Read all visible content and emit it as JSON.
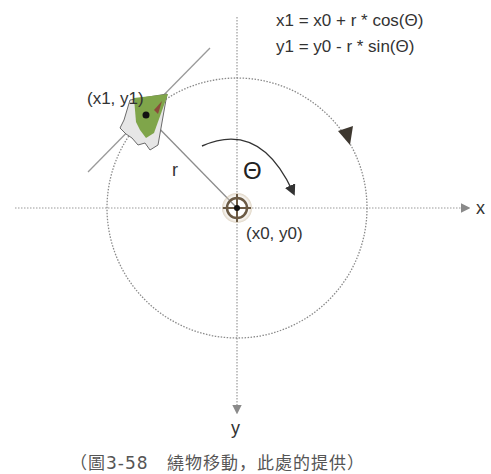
{
  "formulas": {
    "x1": "x1 = x0 + r * cos(Θ)",
    "y1": "y1 = y0 - r * sin(Θ)"
  },
  "labels": {
    "point1": "(x1, y1)",
    "point0": "(x0, y0)",
    "radius": "r",
    "angle": "Θ",
    "x_axis": "x",
    "y_axis": "y"
  },
  "caption": "（圖3-58　繞物移動，此處的提供）",
  "colors": {
    "object_green": "#7fa54a",
    "object_shadow": "#cfcfcf",
    "axis": "#9a9a9a",
    "circle": "#8a8a8a",
    "line": "#8c8c8c",
    "arrow_dark": "#3e3830",
    "target_ring": "#6b5a44",
    "text": "#333333"
  },
  "geometry": {
    "center": [
      237,
      208
    ],
    "radius": 130
  }
}
